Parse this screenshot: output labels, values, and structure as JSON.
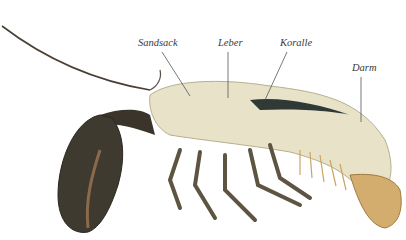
{
  "figure": {
    "labels": [
      {
        "id": "sandsack",
        "text": "Sandsack",
        "x": 138,
        "y": 37,
        "line": [
          162,
          52,
          190,
          96
        ]
      },
      {
        "id": "leber",
        "text": "Leber",
        "x": 218,
        "y": 37,
        "line": [
          228,
          52,
          228,
          98
        ]
      },
      {
        "id": "koralle",
        "text": "Koralle",
        "x": 280,
        "y": 37,
        "line": [
          287,
          52,
          265,
          100
        ]
      },
      {
        "id": "darm",
        "text": "Darm",
        "x": 352,
        "y": 62,
        "line": [
          361,
          77,
          361,
          122
        ]
      }
    ]
  }
}
